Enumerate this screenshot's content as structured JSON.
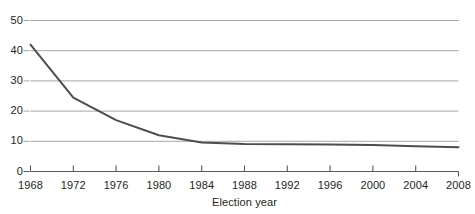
{
  "chart_data": {
    "type": "line",
    "title": "",
    "xlabel": "Election year",
    "ylabel": "",
    "x": [
      1968,
      1972,
      1976,
      1980,
      1984,
      1988,
      1992,
      1996,
      2000,
      2004,
      2008
    ],
    "values": [
      42,
      24.5,
      17,
      12,
      9.6,
      9.1,
      9.0,
      8.9,
      8.8,
      8.4,
      8.0
    ],
    "series": [
      {
        "name": "",
        "values": [
          42,
          24.5,
          17,
          12,
          9.6,
          9.1,
          9.0,
          8.9,
          8.8,
          8.4,
          8.0
        ]
      }
    ],
    "xlim": [
      1968,
      2008
    ],
    "ylim": [
      0,
      50
    ],
    "xticks": [
      "1968",
      "1972",
      "1976",
      "1980",
      "1984",
      "1988",
      "1992",
      "1996",
      "2000",
      "2004",
      "2008"
    ],
    "yticks": [
      "0",
      "10",
      "20",
      "30",
      "40",
      "50"
    ],
    "grid": true,
    "legend": false,
    "legend_position": "none",
    "colors": {
      "line": "#4d4d4d",
      "gridline": "#a7a7a7",
      "axis": "#58595b",
      "text": "#231f20",
      "background": "#ffffff"
    }
  }
}
